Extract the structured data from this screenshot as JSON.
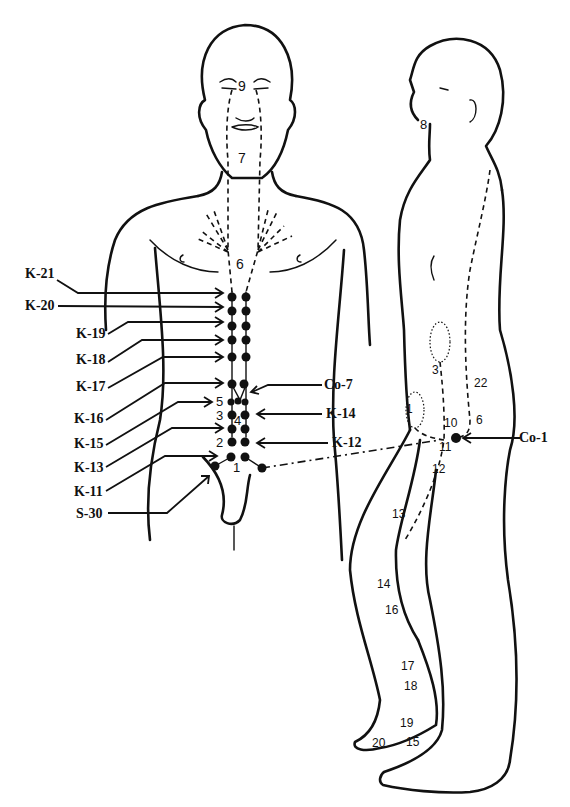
{
  "figure": {
    "colors": {
      "ink": "#111111",
      "background": "#ffffff"
    }
  },
  "front_figure": {
    "callout_labels": [
      {
        "id": "K-21",
        "label": "K-21"
      },
      {
        "id": "K-20",
        "label": "K-20"
      },
      {
        "id": "K-19",
        "label": "K-19"
      },
      {
        "id": "K-18",
        "label": "K-18"
      },
      {
        "id": "K-17",
        "label": "K-17"
      },
      {
        "id": "K-16",
        "label": "K-16"
      },
      {
        "id": "K-15",
        "label": "K-15"
      },
      {
        "id": "K-13",
        "label": "K-13"
      },
      {
        "id": "K-11",
        "label": "K-11"
      },
      {
        "id": "S-30",
        "label": "S-30"
      },
      {
        "id": "Co-7",
        "label": "Co-7"
      },
      {
        "id": "K-14",
        "label": "K-14"
      },
      {
        "id": "K-12",
        "label": "K-12"
      }
    ],
    "numbers": [
      "9",
      "7",
      "6",
      "5",
      "3",
      "4",
      "2",
      "1"
    ]
  },
  "side_figure": {
    "callout_labels": [
      {
        "id": "Co-1",
        "label": "Co-1"
      }
    ],
    "numbers": [
      "8",
      "3",
      "22",
      "1",
      "10",
      "6",
      "11",
      "12",
      "13",
      "14",
      "16",
      "17",
      "18",
      "19",
      "20",
      "15"
    ]
  }
}
